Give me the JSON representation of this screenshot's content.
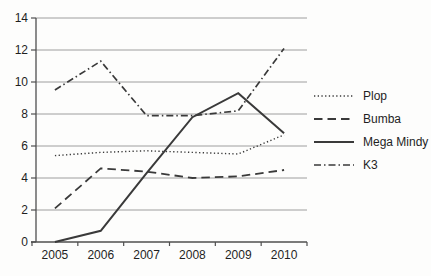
{
  "chart_data": {
    "type": "line",
    "title": "",
    "xlabel": "",
    "ylabel": "",
    "categories": [
      "2005",
      "2006",
      "2007",
      "2008",
      "2009",
      "2010"
    ],
    "series": [
      {
        "name": "Plop",
        "style": "dotted",
        "values": [
          5.4,
          5.6,
          5.7,
          5.6,
          5.5,
          6.7
        ]
      },
      {
        "name": "Bumba",
        "style": "dashed",
        "values": [
          2.1,
          4.6,
          4.4,
          4.0,
          4.1,
          4.5
        ]
      },
      {
        "name": "Mega Mindy",
        "style": "solid",
        "values": [
          0.0,
          0.7,
          4.3,
          7.8,
          9.3,
          6.8
        ]
      },
      {
        "name": "K3",
        "style": "dashdot",
        "values": [
          9.5,
          11.3,
          7.9,
          7.9,
          8.2,
          12.1
        ]
      }
    ],
    "ylim": [
      0,
      14
    ],
    "yticks": [
      0,
      2,
      4,
      6,
      8,
      10,
      12,
      14
    ],
    "grid": true,
    "legend_position": "right"
  },
  "colors": {
    "line": "#3a3a3a",
    "gridline": "#9e9e9e",
    "axis": "#4f4f4f",
    "text": "#1f1f1f",
    "background": "#fdfdfc"
  }
}
